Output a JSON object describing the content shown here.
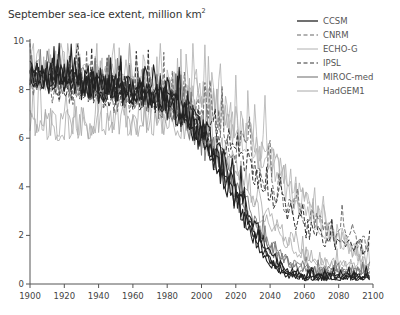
{
  "chart_data": {
    "type": "line",
    "title_main": "September sea-ice extent, million km",
    "title_sup": "2",
    "xlabel": "",
    "ylabel": "",
    "xlim": [
      1900,
      2100
    ],
    "ylim": [
      0,
      10
    ],
    "x_ticks": [
      1900,
      1920,
      1940,
      1960,
      1980,
      2000,
      2020,
      2040,
      2060,
      2080,
      2100
    ],
    "y_ticks": [
      0,
      2,
      4,
      6,
      8,
      10
    ],
    "grid": false,
    "legend_position": "top-right",
    "note": "Multiple ensemble members per model; values below are approximate decadal means read from the figure (noisy annual lines rendered around these).",
    "x": [
      1900,
      1910,
      1920,
      1930,
      1940,
      1950,
      1960,
      1970,
      1980,
      1990,
      2000,
      2010,
      2020,
      2030,
      2040,
      2050,
      2060,
      2070,
      2080,
      2090,
      2100
    ],
    "series": [
      {
        "name": "CCSM",
        "style": "solid",
        "color": "#222222",
        "width": 1.1,
        "members": 4,
        "noise": 0.45,
        "values": [
          8.6,
          8.5,
          8.4,
          8.2,
          8.1,
          8.0,
          7.9,
          7.7,
          7.4,
          6.8,
          6.0,
          4.8,
          3.4,
          2.0,
          0.9,
          0.4,
          0.3,
          0.3,
          0.3,
          0.3,
          0.3
        ]
      },
      {
        "name": "CNRM",
        "style": "dashed",
        "color": "#666666",
        "width": 0.9,
        "members": 1,
        "noise": 0.6,
        "values": [
          8.4,
          8.3,
          8.2,
          8.1,
          8.0,
          7.9,
          7.8,
          7.7,
          7.6,
          7.4,
          7.1,
          6.7,
          6.1,
          5.4,
          4.6,
          3.8,
          3.0,
          2.6,
          2.3,
          2.1,
          1.6
        ]
      },
      {
        "name": "ECHO-G",
        "style": "solid",
        "color": "#b0b0b0",
        "width": 0.8,
        "members": 3,
        "noise": 0.7,
        "values": [
          8.7,
          8.6,
          8.6,
          8.5,
          8.4,
          8.3,
          8.2,
          8.1,
          8.0,
          7.8,
          7.5,
          7.1,
          6.6,
          5.9,
          5.0,
          4.2,
          3.3,
          2.6,
          2.0,
          1.5,
          1.0
        ]
      },
      {
        "name": "IPSL",
        "style": "dashed",
        "color": "#333333",
        "width": 1.0,
        "members": 1,
        "noise": 0.55,
        "values": [
          8.2,
          8.1,
          8.0,
          7.9,
          7.8,
          7.7,
          7.6,
          7.4,
          7.2,
          6.9,
          6.5,
          6.0,
          5.3,
          4.5,
          3.6,
          2.8,
          2.2,
          1.8,
          1.6,
          1.5,
          1.3
        ]
      },
      {
        "name": "MIROC-med",
        "style": "solid",
        "color": "#777777",
        "width": 0.9,
        "members": 3,
        "noise": 0.45,
        "values": [
          8.5,
          8.4,
          8.3,
          8.2,
          8.1,
          8.0,
          7.8,
          7.6,
          7.3,
          6.8,
          6.1,
          5.1,
          3.9,
          2.6,
          1.6,
          0.9,
          0.6,
          0.5,
          0.5,
          0.5,
          0.5
        ]
      },
      {
        "name": "HadGEM1",
        "style": "solid",
        "color": "#a8a8a8",
        "width": 0.8,
        "members": 2,
        "noise": 0.55,
        "values": [
          6.5,
          6.5,
          6.5,
          6.6,
          6.6,
          6.6,
          6.6,
          6.6,
          6.7,
          6.6,
          6.3,
          5.7,
          4.8,
          3.8,
          2.8,
          1.9,
          1.3,
          1.0,
          0.8,
          0.7,
          0.6
        ]
      }
    ]
  }
}
